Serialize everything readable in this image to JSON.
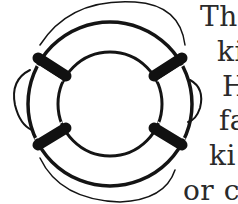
{
  "document": {
    "illustration": "life-preserver-ring",
    "text_lines": [
      {
        "text": "The",
        "x": 200,
        "y": 3
      },
      {
        "text": "ki",
        "x": 217,
        "y": 38
      },
      {
        "text": "H",
        "x": 222,
        "y": 73
      },
      {
        "text": "fa",
        "x": 219,
        "y": 107
      },
      {
        "text": "ki",
        "x": 209,
        "y": 142
      },
      {
        "text": "or cl",
        "x": 183,
        "y": 177
      }
    ]
  }
}
